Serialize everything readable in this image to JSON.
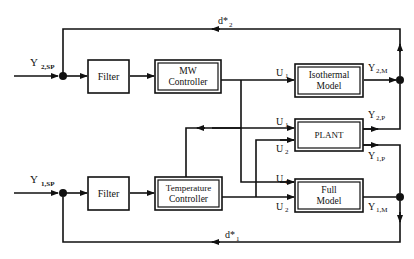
{
  "diagram": {
    "type": "control-block-diagram",
    "inputs": {
      "top_setpoint": {
        "main": "Y",
        "sub": "2,SP"
      },
      "bottom_setpoint": {
        "main": "Y",
        "sub": "1,SP"
      }
    },
    "blocks": {
      "filter_top": {
        "label": "Filter"
      },
      "filter_bottom": {
        "label": "Filter"
      },
      "mw_controller": {
        "line1": "MW",
        "line2": "Controller"
      },
      "temp_controller": {
        "line1": "Temperature",
        "line2": "Controller"
      },
      "isothermal_model": {
        "line1": "Isothermal",
        "line2": "Model"
      },
      "plant": {
        "label": "PLANT"
      },
      "full_model": {
        "line1": "Full",
        "line2": "Model"
      }
    },
    "signals": {
      "d2": {
        "main": "d*",
        "sub": "2"
      },
      "d1": {
        "main": "d*",
        "sub": "1"
      },
      "u1_iso": {
        "main": "U",
        "sub": "1"
      },
      "u1_plant": {
        "main": "U",
        "sub": "1"
      },
      "u2_plant": {
        "main": "U",
        "sub": "2"
      },
      "u1_full": {
        "main": "U",
        "sub": "1"
      },
      "u2_full": {
        "main": "U",
        "sub": "2"
      },
      "y2m": {
        "main": "Y",
        "sub": "2,M"
      },
      "y2p": {
        "main": "Y",
        "sub": "2,P"
      },
      "y1p": {
        "main": "Y",
        "sub": "1,P"
      },
      "y1m": {
        "main": "Y",
        "sub": "1,M"
      }
    }
  }
}
